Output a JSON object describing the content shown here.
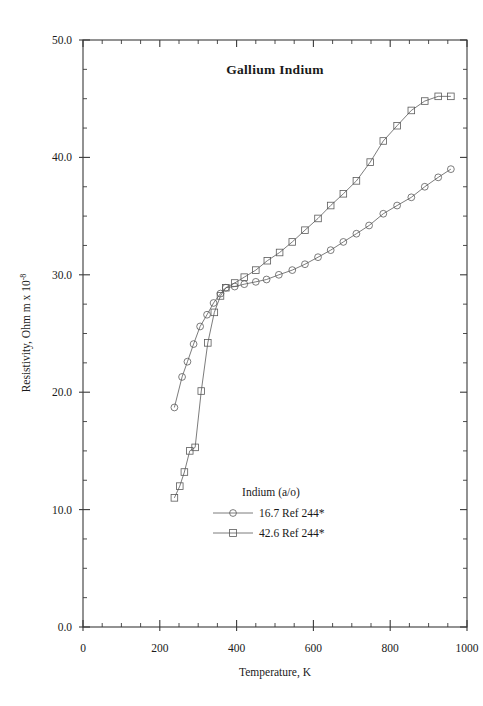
{
  "chart_data": {
    "type": "line",
    "title": "Gallium  Indium",
    "xlabel": "Temperature,  K",
    "ylabel_main": "Resistivity, Ohm m x 10",
    "ylabel_exponent": "-8",
    "xlim": [
      0,
      1000
    ],
    "ylim": [
      0,
      50
    ],
    "xticks": [
      0,
      200,
      400,
      600,
      800,
      1000
    ],
    "xticklabels": [
      "0",
      "200",
      "400",
      "600",
      "800",
      "1000"
    ],
    "yticks": [
      0,
      10,
      20,
      30,
      40,
      50
    ],
    "yticklabels": [
      "0.0",
      "10.0",
      "20.0",
      "30.0",
      "40.0",
      "50.0"
    ],
    "x_minor_interval": 50,
    "y_minor_interval": 2.5,
    "grid": false,
    "legend_position": "inside lower center",
    "legend_title": "Indium (a/o)",
    "series": [
      {
        "name": "16.7 Ref 244*",
        "marker": "circle",
        "x": [
          238,
          258,
          272,
          288,
          305,
          323,
          340,
          358,
          372,
          395,
          420,
          450,
          478,
          510,
          545,
          578,
          612,
          645,
          678,
          712,
          745,
          782,
          818,
          855,
          890,
          925,
          958
        ],
        "y": [
          18.7,
          21.3,
          22.6,
          24.1,
          25.6,
          26.6,
          27.6,
          28.4,
          28.9,
          29.0,
          29.2,
          29.4,
          29.6,
          30.0,
          30.4,
          30.9,
          31.5,
          32.1,
          32.8,
          33.5,
          34.2,
          35.2,
          35.9,
          36.6,
          37.5,
          38.3,
          39.0
        ]
      },
      {
        "name": "42.6 Ref 244*",
        "marker": "square",
        "x": [
          238,
          252,
          264,
          278,
          292,
          308,
          325,
          342,
          358,
          372,
          395,
          420,
          450,
          480,
          512,
          545,
          578,
          612,
          645,
          678,
          712,
          748,
          782,
          818,
          855,
          890,
          925,
          958
        ],
        "y": [
          11.0,
          12.0,
          13.2,
          15.0,
          15.3,
          20.1,
          24.2,
          26.8,
          28.2,
          28.9,
          29.3,
          29.8,
          30.4,
          31.2,
          31.9,
          32.8,
          33.8,
          34.8,
          35.9,
          36.9,
          38.0,
          39.6,
          41.4,
          42.7,
          44.0,
          44.8,
          45.2,
          45.2
        ]
      }
    ]
  },
  "figure": {
    "background": "#ffffff",
    "line_color": "#5a5a5a",
    "axis_color": "#3a3a3a"
  }
}
